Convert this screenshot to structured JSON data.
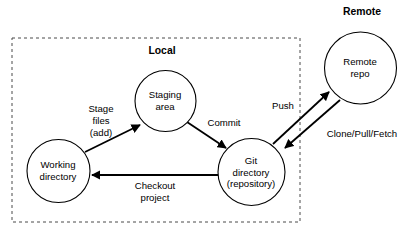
{
  "diagram": {
    "type": "node-edge-diagram",
    "colors": {
      "stroke": "#000000",
      "background": "#ffffff",
      "group_border": "#4a4a4a"
    },
    "groups": [
      {
        "id": "local",
        "label": "Local"
      },
      {
        "id": "remote",
        "label": "Remote"
      }
    ],
    "nodes": [
      {
        "id": "working",
        "label_line1": "Working",
        "label_line2": "directory",
        "label_line3": ""
      },
      {
        "id": "staging",
        "label_line1": "Staging",
        "label_line2": "area",
        "label_line3": ""
      },
      {
        "id": "gitdir",
        "label_line1": "Git",
        "label_line2": "directory",
        "label_line3": "(repository)"
      },
      {
        "id": "remoterepo",
        "label_line1": "Remote",
        "label_line2": "repo",
        "label_line3": ""
      }
    ],
    "edges": [
      {
        "id": "stage",
        "label_line1": "Stage",
        "label_line2": "files",
        "label_line3": "(add)",
        "from": "working",
        "to": "staging"
      },
      {
        "id": "commit",
        "label_line1": "Commit",
        "label_line2": "",
        "label_line3": "",
        "from": "staging",
        "to": "gitdir"
      },
      {
        "id": "checkout",
        "label_line1": "Checkout",
        "label_line2": "project",
        "label_line3": "",
        "from": "gitdir",
        "to": "working"
      },
      {
        "id": "push",
        "label_line1": "Push",
        "label_line2": "",
        "label_line3": "",
        "from": "gitdir",
        "to": "remoterepo"
      },
      {
        "id": "clone",
        "label_line1": "Clone/Pull/Fetch",
        "label_line2": "",
        "label_line3": "",
        "from": "remoterepo",
        "to": "gitdir"
      }
    ]
  }
}
